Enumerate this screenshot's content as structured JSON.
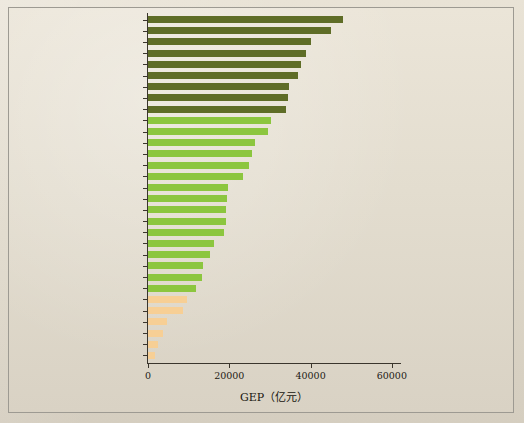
{
  "chart_data": {
    "type": "bar",
    "orientation": "horizontal",
    "title": "",
    "xlabel": "GEP（亿元）",
    "ylabel": "",
    "xlim": [
      0,
      62000
    ],
    "xticks": [
      0,
      20000,
      40000,
      60000
    ],
    "xticklabels": [
      "0",
      "20000",
      "40000",
      "60000"
    ],
    "grid": false,
    "legend": null,
    "categories": [
      "四川",
      "云南",
      "广西",
      "湖南",
      "内蒙古",
      "江西",
      "广东",
      "湖北",
      "西藏",
      "福建",
      "新疆",
      "安徽",
      "贵州",
      "江苏",
      "黑龙江",
      "浙江",
      "山东",
      "青海",
      "河南",
      "陕西",
      "河北",
      "辽宁",
      "重庆",
      "吉林",
      "甘肃",
      "海南",
      "山西",
      "宁夏",
      "北京",
      "天津",
      "上海"
    ],
    "values": [
      48000,
      45000,
      40200,
      38800,
      37600,
      37000,
      34800,
      34400,
      34000,
      30200,
      29400,
      26300,
      25500,
      24800,
      23400,
      19600,
      19400,
      19300,
      19100,
      18700,
      16300,
      15200,
      13600,
      13200,
      11900,
      9500,
      8600,
      4600,
      3700,
      2400,
      1800
    ],
    "colors_by_group": {
      "dark_olive": "#5f6d27",
      "light_green": "#8cc63f",
      "peach": "#f7cf95"
    },
    "group_of_bar": [
      "dark_olive",
      "dark_olive",
      "dark_olive",
      "dark_olive",
      "dark_olive",
      "dark_olive",
      "dark_olive",
      "dark_olive",
      "dark_olive",
      "light_green",
      "light_green",
      "light_green",
      "light_green",
      "light_green",
      "light_green",
      "light_green",
      "light_green",
      "light_green",
      "light_green",
      "light_green",
      "light_green",
      "light_green",
      "light_green",
      "light_green",
      "light_green",
      "peach",
      "peach",
      "peach",
      "peach",
      "peach",
      "peach"
    ]
  },
  "figure": {
    "background_color": "#e3ddcf",
    "border_color": "#9d9a92",
    "axis_color": "#3a352c"
  }
}
